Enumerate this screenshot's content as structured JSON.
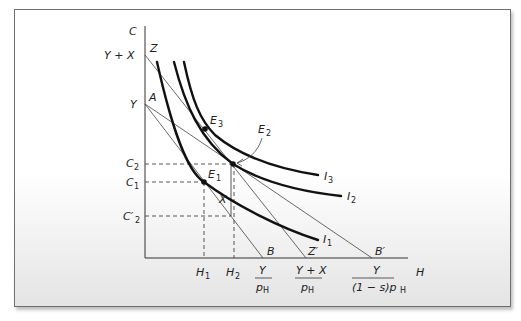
{
  "diagram": {
    "type": "indifference-curve-budget-constraint",
    "axes": {
      "y_label": "C",
      "x_label": "H"
    },
    "y_ticks": {
      "y_plus_x": "Y + X",
      "y": "Y",
      "c2": "C",
      "c2_sub": "2",
      "c1": "C",
      "c1_sub": "1",
      "c2p": "C′",
      "c2p_sub": "2"
    },
    "x_ticks": {
      "h1": "H",
      "h1_sub": "1",
      "h2": "H",
      "h2_sub": "2",
      "b_num": "Y",
      "b_den": "p",
      "b_den_sub": "H",
      "z_num": "Y + X",
      "z_den": "p",
      "z_den_sub": "H",
      "bp_num": "Y",
      "bp_den": "(1 − s)p",
      "bp_den_sub": "H"
    },
    "points": {
      "z": "Z",
      "a": "A",
      "b": "B",
      "zp": "Z′",
      "bp": "B′",
      "x": "X",
      "e1": "E",
      "e1_sub": "1",
      "e2": "E",
      "e2_sub": "2",
      "e3": "E",
      "e3_sub": "3"
    },
    "curves": {
      "i1": "I",
      "i1_sub": "1",
      "i2": "I",
      "i2_sub": "2",
      "i3": "I",
      "i3_sub": "3"
    },
    "colors": {
      "frame_border": "#6f6f6f",
      "ink": "#111111"
    }
  }
}
